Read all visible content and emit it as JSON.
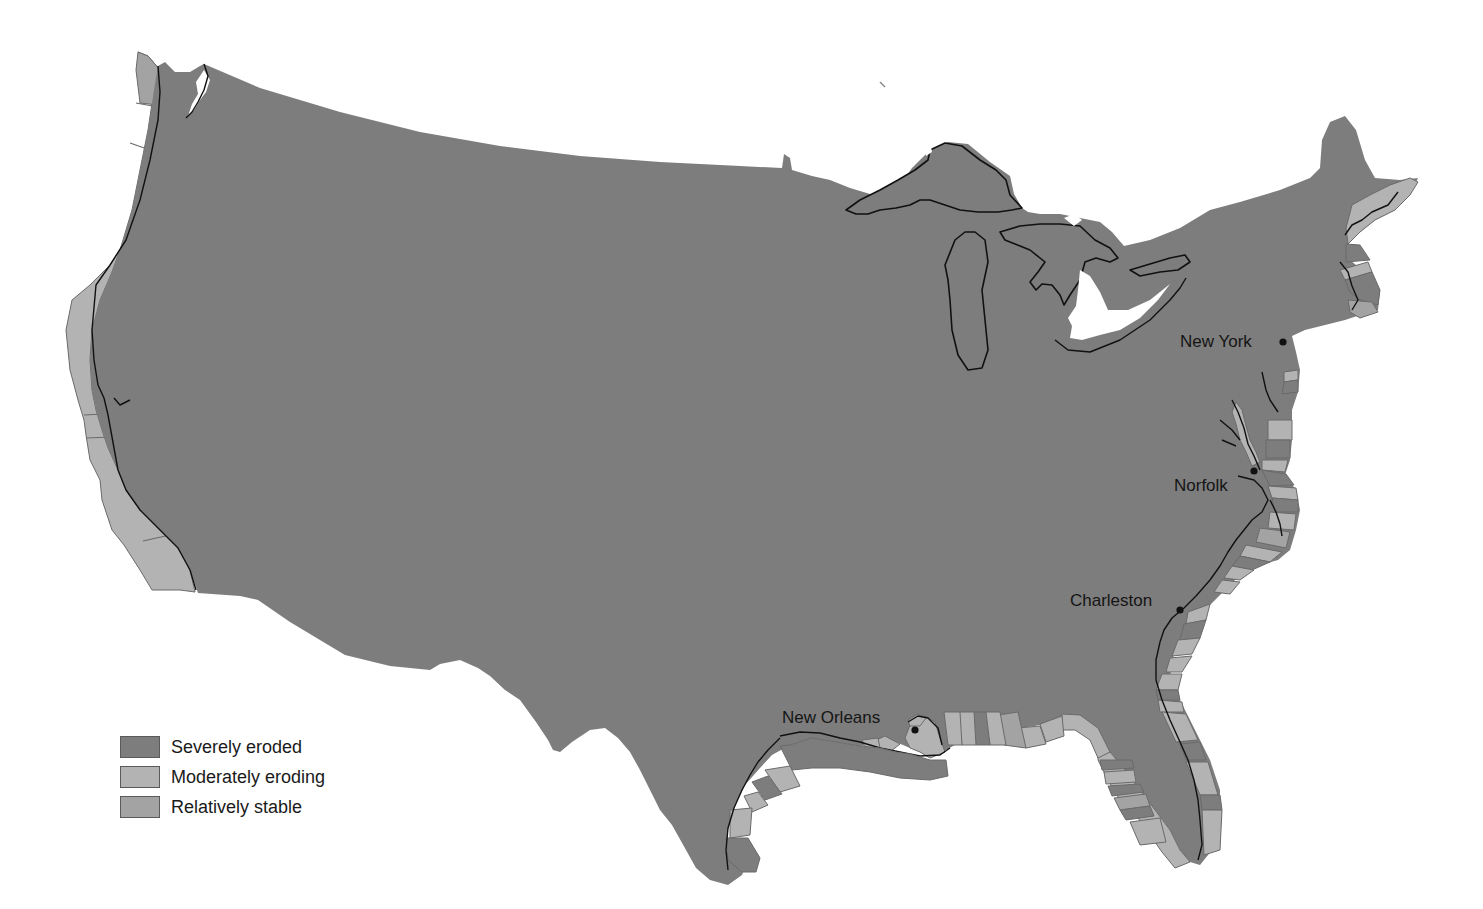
{
  "map": {
    "type": "thematic-choropleth",
    "region": "Contiguous United States",
    "subject": "Coastal erosion status",
    "colors": {
      "severely_eroded": "#7d7d7d",
      "moderately_eroding": "#b3b3b3",
      "relatively_stable": "#a3a3a3",
      "background": "#ffffff",
      "coastline": "#111111"
    }
  },
  "cities": [
    {
      "name": "New York",
      "label_x": 1180,
      "label_y": 333,
      "dot_x": 1283,
      "dot_y": 342
    },
    {
      "name": "Norfolk",
      "label_x": 1174,
      "label_y": 477,
      "dot_x": 1254,
      "dot_y": 471
    },
    {
      "name": "Charleston",
      "label_x": 1070,
      "label_y": 592,
      "dot_x": 1180,
      "dot_y": 610
    },
    {
      "name": "New Orleans",
      "label_x": 782,
      "label_y": 709,
      "dot_x": 915,
      "dot_y": 730
    }
  ],
  "legend": {
    "items": [
      {
        "label": "Severely eroded",
        "color": "#7d7d7d"
      },
      {
        "label": "Moderately eroding",
        "color": "#b3b3b3"
      },
      {
        "label": "Relatively stable",
        "color": "#a3a3a3"
      }
    ]
  }
}
